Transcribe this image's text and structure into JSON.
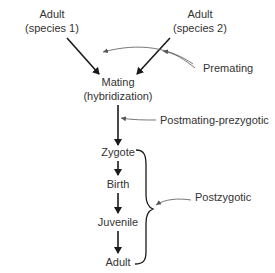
{
  "nodes": {
    "adult_species1": {
      "line1": "Adult",
      "line2": "(species 1)"
    },
    "adult_species2": {
      "line1": "Adult",
      "line2": "(species 2)"
    },
    "mating": {
      "line1": "Mating",
      "line2": "(hybridization)"
    },
    "zygote": "Zygote",
    "birth": "Birth",
    "juvenile": "Juvenile",
    "adult": "Adult"
  },
  "barriers": {
    "premating": "Premating",
    "postmating_prezygotic": "Postmating-prezygotic",
    "postzygotic": "Postzygotic"
  },
  "colors": {
    "arrow": "#1a1a1a",
    "pointer": "#555555",
    "text": "#333333"
  }
}
